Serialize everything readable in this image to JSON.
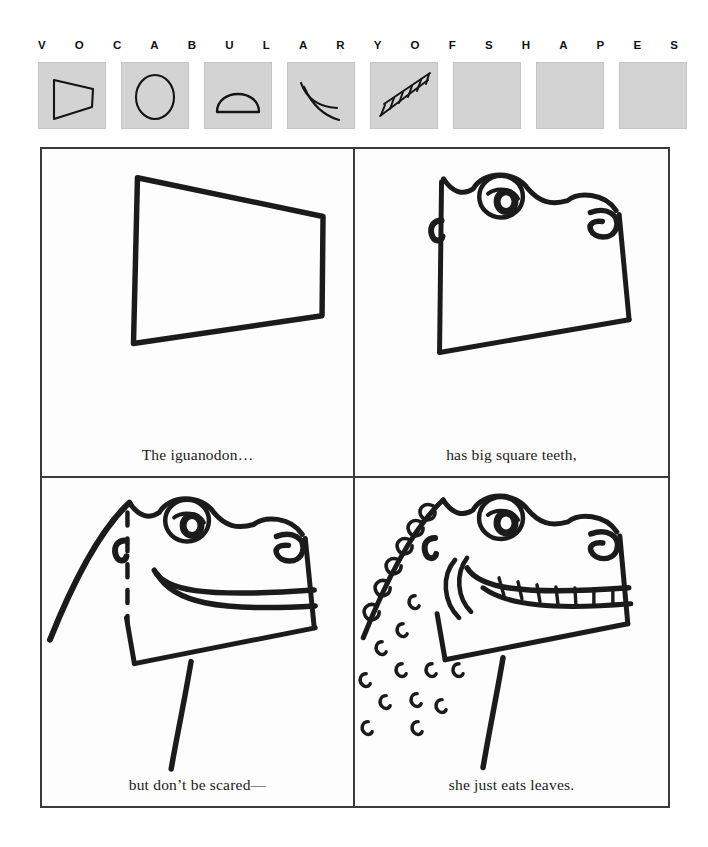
{
  "header": {
    "letters": [
      "V",
      "O",
      "C",
      "A",
      "B",
      "U",
      "L",
      "A",
      "R",
      "Y",
      "O",
      "F",
      "S",
      "H",
      "A",
      "P",
      "E",
      "S"
    ],
    "swatch_fill": "#d3d3d3",
    "ink_color": "#111111"
  },
  "swatches": [
    {
      "name": "trapezoid-swatch",
      "shape": "trapezoid",
      "label": "trapezoid",
      "filled": true
    },
    {
      "name": "circle-swatch",
      "shape": "circle",
      "label": "circle",
      "filled": true
    },
    {
      "name": "dome-swatch",
      "shape": "dome",
      "label": "dome",
      "filled": true
    },
    {
      "name": "curves-swatch",
      "shape": "curves",
      "label": "curved lines",
      "filled": true
    },
    {
      "name": "ladder-swatch",
      "shape": "ladder",
      "label": "ladder band",
      "filled": true
    },
    {
      "name": "blank-swatch-1",
      "shape": "blank",
      "label": "blank",
      "filled": false
    },
    {
      "name": "blank-swatch-2",
      "shape": "blank",
      "label": "blank",
      "filled": false
    },
    {
      "name": "blank-swatch-3",
      "shape": "blank",
      "label": "blank",
      "filled": false
    }
  ],
  "comic": {
    "panels": [
      {
        "name": "panel-1",
        "step": 1,
        "caption": "The iguanodon…",
        "art": "trapezoid-head-outline"
      },
      {
        "name": "panel-2",
        "step": 2,
        "caption": "has big square teeth,",
        "art": "head-with-eyes-and-nostril"
      },
      {
        "name": "panel-3",
        "step": 3,
        "caption": "but don’t be scared—",
        "art": "head-with-smile-and-neck"
      },
      {
        "name": "panel-4",
        "step": 4,
        "caption": "she just eats leaves.",
        "art": "finished-iguanodon-with-teeth-and-scales"
      }
    ]
  }
}
